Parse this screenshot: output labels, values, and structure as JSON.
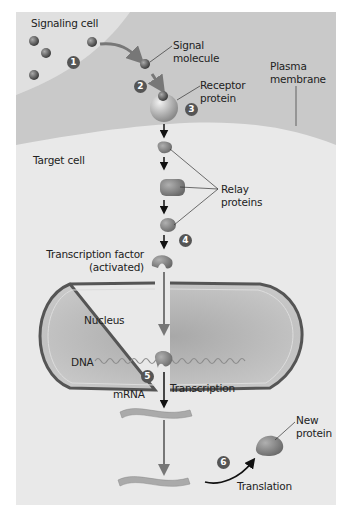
{
  "figure": {
    "labels": {
      "signaling_cell": "Signaling cell",
      "signal_molecule_line1": "Signal",
      "signal_molecule_line2": "molecule",
      "receptor_line1": "Receptor",
      "receptor_line2": "protein",
      "plasma_line1": "Plasma",
      "plasma_line2": "membrane",
      "target_cell": "Target cell",
      "relay_line1": "Relay",
      "relay_line2": "proteins",
      "tf_line1": "Transcription factor",
      "tf_line2": "(activated)",
      "nucleus": "Nucleus",
      "dna": "DNA",
      "transcription": "Transcription",
      "mrna": "mRNA",
      "new_protein_line1": "New",
      "new_protein_line2": "protein",
      "translation": "Translation"
    },
    "steps": [
      "1",
      "2",
      "3",
      "4",
      "5",
      "6"
    ],
    "colors": {
      "panel": "#e6e6e6",
      "membrane": "#c8c8c8",
      "target": "#eaeaea",
      "nucleus": "#b5b5b5",
      "nuclear_envelope": "#555555",
      "molecule": "#6a6a6a",
      "step_badge": "#555555"
    }
  }
}
